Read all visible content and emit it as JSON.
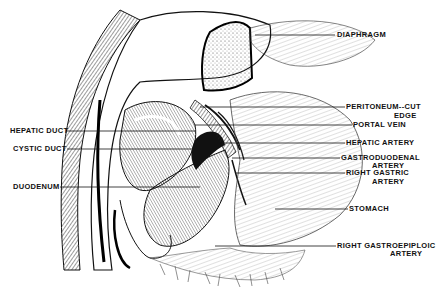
{
  "figure": {
    "type": "anatomical-illustration"
  },
  "labels_right": [
    {
      "id": "diaphragm",
      "text": "DIAPHRAGM",
      "line2": ""
    },
    {
      "id": "peritoneum",
      "text": "PERITONEUM--CUT",
      "line2": "EDGE"
    },
    {
      "id": "portal-vein",
      "text": "PORTAL VEIN",
      "line2": ""
    },
    {
      "id": "hepatic-artery",
      "text": "HEPATIC ARTERY",
      "line2": ""
    },
    {
      "id": "gastroduodenal",
      "text": "GASTRODUODENAL",
      "line2": "ARTERY"
    },
    {
      "id": "right-gastric",
      "text": "RIGHT GASTRIC",
      "line2": "ARTERY"
    },
    {
      "id": "stomach",
      "text": "STOMACH",
      "line2": ""
    },
    {
      "id": "right-gastroepiploic",
      "text": "RIGHT GASTROEPIPLOIC",
      "line2": "ARTERY"
    }
  ],
  "labels_left": [
    {
      "id": "hepatic-duct",
      "text": "HEPATIC DUCT"
    },
    {
      "id": "cystic-duct",
      "text": "CYSTIC DUCT"
    },
    {
      "id": "duodenum",
      "text": "DUODENUM"
    }
  ]
}
